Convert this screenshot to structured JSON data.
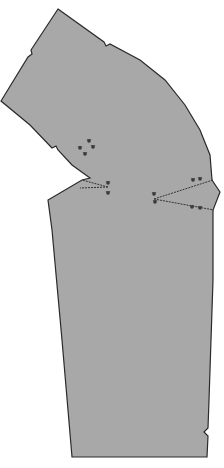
{
  "diagram": {
    "type": "sewing-pattern-piece",
    "colors": {
      "background": "#ffffff",
      "fill": "#a8a8a8",
      "outline": "#2a2a2a",
      "dart_line": "#333333",
      "marker": "#3a3a3a"
    },
    "outline_points": [
      [
        58,
        9
      ],
      [
        104,
        42
      ],
      [
        106,
        46
      ],
      [
        110,
        44
      ],
      [
        140,
        60
      ],
      [
        165,
        80
      ],
      [
        185,
        105
      ],
      [
        200,
        130
      ],
      [
        210,
        155
      ],
      [
        212,
        180
      ],
      [
        220,
        192
      ],
      [
        213,
        210
      ],
      [
        213,
        280
      ],
      [
        211,
        340
      ],
      [
        209,
        400
      ],
      [
        208,
        428
      ],
      [
        204,
        432
      ],
      [
        208,
        436
      ],
      [
        207,
        457
      ],
      [
        72,
        457
      ],
      [
        62,
        340
      ],
      [
        52,
        230
      ],
      [
        48,
        200
      ],
      [
        82,
        180
      ],
      [
        90,
        178
      ],
      [
        72,
        165
      ],
      [
        58,
        150
      ],
      [
        56,
        146
      ],
      [
        52,
        148
      ],
      [
        30,
        125
      ],
      [
        1,
        101
      ],
      [
        28,
        57
      ],
      [
        32,
        54
      ],
      [
        31,
        50
      ]
    ],
    "notches": [
      {
        "name": "top-notch",
        "x": 106,
        "y": 44
      },
      {
        "name": "left-upper-notch",
        "x": 31,
        "y": 54
      },
      {
        "name": "left-lower-notch",
        "x": 57,
        "y": 147
      },
      {
        "name": "right-hem-notch",
        "x": 206,
        "y": 432
      }
    ],
    "darts": [
      {
        "name": "left-dart",
        "apex": [
          108,
          187
        ],
        "legs": [
          [
            82,
            180
          ],
          [
            80,
            188
          ]
        ]
      },
      {
        "name": "right-dart",
        "apex": [
          154,
          199
        ],
        "legs": [
          [
            213,
            180
          ],
          [
            214,
            210
          ]
        ]
      }
    ],
    "markers": [
      {
        "name": "circle-marker-1",
        "x": 89,
        "y": 141
      },
      {
        "name": "circle-marker-2",
        "x": 80,
        "y": 148
      },
      {
        "name": "circle-marker-3",
        "x": 93,
        "y": 147
      },
      {
        "name": "circle-marker-4",
        "x": 85,
        "y": 154
      },
      {
        "name": "dart-marker-left-a",
        "x": 108,
        "y": 183
      },
      {
        "name": "dart-marker-left-b",
        "x": 108,
        "y": 193
      },
      {
        "name": "dart-marker-right-a",
        "x": 154,
        "y": 194
      },
      {
        "name": "dart-marker-right-b",
        "x": 155,
        "y": 202
      },
      {
        "name": "dart-marker-right-c",
        "x": 193,
        "y": 180
      },
      {
        "name": "dart-marker-right-d",
        "x": 200,
        "y": 179
      },
      {
        "name": "dart-marker-right-e",
        "x": 192,
        "y": 207
      },
      {
        "name": "dart-marker-right-f",
        "x": 200,
        "y": 208
      }
    ]
  }
}
